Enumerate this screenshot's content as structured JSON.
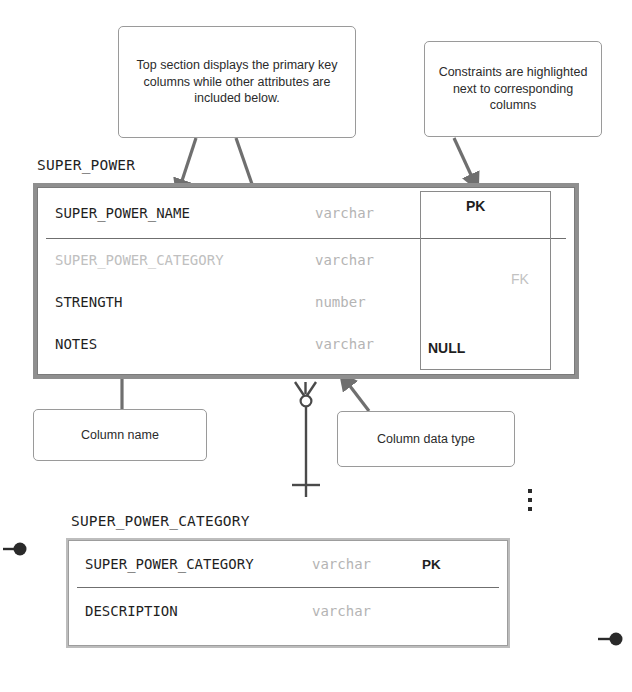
{
  "callouts": [
    {
      "id": "top-section",
      "text": "Top section displays the primary key columns while other attributes are included below."
    },
    {
      "id": "constraints",
      "text": "Constraints are highlighted next to corresponding columns"
    },
    {
      "id": "column-name",
      "text": "Column name"
    },
    {
      "id": "column-datatype",
      "text": "Column data type"
    }
  ],
  "entities": [
    {
      "id": "super-power",
      "name": "SUPER_POWER",
      "primary_key_columns": [
        {
          "name": "SUPER_POWER_NAME",
          "type": "varchar",
          "constraint": "PK",
          "dimmed_name": false,
          "dimmed_constraint": false
        }
      ],
      "other_columns": [
        {
          "name": "SUPER_POWER_CATEGORY",
          "type": "varchar",
          "constraint": "FK",
          "dimmed_name": true,
          "dimmed_constraint": true
        },
        {
          "name": "STRENGTH",
          "type": "number",
          "constraint": "",
          "dimmed_name": false,
          "dimmed_constraint": false
        },
        {
          "name": "NOTES",
          "type": "varchar",
          "constraint": "NULL",
          "dimmed_name": false,
          "dimmed_constraint": false
        }
      ]
    },
    {
      "id": "super-power-category",
      "name": "SUPER_POWER_CATEGORY",
      "primary_key_columns": [
        {
          "name": "SUPER_POWER_CATEGORY",
          "type": "varchar",
          "constraint": "PK",
          "dimmed_name": false,
          "dimmed_constraint": false
        }
      ],
      "other_columns": [
        {
          "name": "DESCRIPTION",
          "type": "varchar",
          "constraint": "",
          "dimmed_name": false,
          "dimmed_constraint": false
        }
      ]
    }
  ],
  "constraint_labels": {
    "pk": "PK",
    "fk": "FK",
    "null": "NULL"
  },
  "relationship": {
    "from": "SUPER_POWER",
    "to": "SUPER_POWER_CATEGORY",
    "child_cardinality": "zero-or-many",
    "parent_cardinality": "exactly-one"
  },
  "colors": {
    "entity_border": "#8f8f8f",
    "entity_border_light": "#bdbdbd",
    "text": "#1f1f1f",
    "muted_text": "#c0c0c0",
    "type_text": "#b4b4b4",
    "connector": "#6f6f6f",
    "callout_border": "#9a9a9a"
  },
  "annotations": {
    "continuation_ellipsis": "⋮"
  }
}
